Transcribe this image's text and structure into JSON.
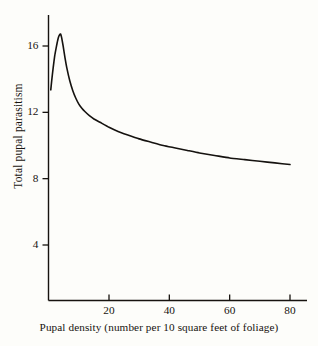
{
  "figure": {
    "background_color": "#fdfdfa",
    "ink_color": "#17130f"
  },
  "chart_data": {
    "type": "line",
    "title": "",
    "xlabel": "Pupal density (number per 10 square feet of foliage)",
    "ylabel": "Total pupal parasitism",
    "xlim": [
      0,
      84
    ],
    "ylim": [
      0,
      18.4
    ],
    "xticks": [
      20,
      40,
      60,
      80
    ],
    "yticks": [
      4,
      8,
      12,
      16
    ],
    "xtick_labels": [
      "20",
      "40",
      "60",
      "80"
    ],
    "ytick_labels": [
      "4",
      "8",
      "12",
      "16"
    ],
    "grid": false,
    "legend": "none",
    "line_color": "#15120f",
    "line_width": 1.6,
    "series": [
      {
        "name": "Total pupal parasitism",
        "x": [
          0.7,
          1.0,
          1.5,
          2.0,
          2.5,
          3.0,
          3.4,
          3.8,
          4.0,
          4.3,
          4.8,
          5.4,
          6.0,
          7.0,
          8.0,
          9.0,
          10.0,
          11.0,
          12.0,
          13.5,
          15.0,
          17.0,
          20.0,
          23.0,
          26.0,
          30.0,
          34.0,
          38.0,
          42.0,
          46.0,
          50.0,
          55.0,
          60.0,
          65.0,
          70.0,
          75.0,
          80.0
        ],
        "y": [
          13.35,
          13.9,
          14.7,
          15.4,
          15.9,
          16.35,
          16.6,
          16.72,
          16.7,
          16.5,
          16.0,
          15.3,
          14.7,
          13.9,
          13.3,
          12.85,
          12.5,
          12.25,
          12.05,
          11.8,
          11.6,
          11.4,
          11.1,
          10.85,
          10.65,
          10.4,
          10.2,
          10.0,
          9.85,
          9.7,
          9.55,
          9.4,
          9.25,
          9.15,
          9.05,
          8.95,
          8.85
        ]
      }
    ],
    "annotations": []
  },
  "axes": {
    "y_axis_name": "y-axis",
    "x_axis_name": "x-axis"
  }
}
